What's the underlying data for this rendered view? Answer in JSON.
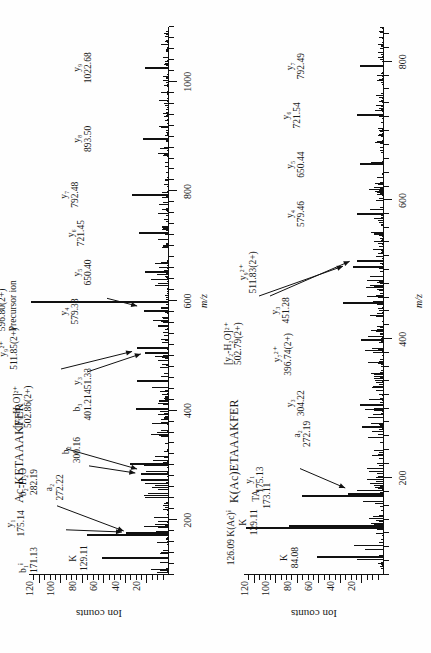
{
  "figure": {
    "axis_y_label": "Ion counts",
    "axis_x_label": "m/z"
  },
  "panels": [
    {
      "id": "panel-a",
      "title": "Ac-KETAAAKFER",
      "xticks": [
        200,
        400,
        600,
        800,
        1000
      ],
      "yticks": [
        20,
        40,
        60,
        80,
        100,
        120
      ],
      "annotations": [
        {
          "name": "ann-k-129",
          "line1": "K",
          "line2": "129.11"
        },
        {
          "name": "ann-b1-171",
          "line1": "b₁ⁱ",
          "line2": "171.13"
        },
        {
          "name": "ann-y1-175",
          "line1": "y₁",
          "line2": "175.14"
        },
        {
          "name": "ann-a2-272",
          "line1": "a₂",
          "line2": "272.22"
        },
        {
          "name": "ann-b2-h2o-282",
          "line1": "b₂-H₂O",
          "line2": "282.19"
        },
        {
          "name": "ann-b2-300",
          "line1": "b₂",
          "line2": "300.16"
        },
        {
          "name": "ann-b3-401",
          "line1": "b₃",
          "line2": "401.21"
        },
        {
          "name": "ann-y3-451",
          "line1": "y₃",
          "line2": "451.33"
        },
        {
          "name": "ann-y9-h2o-502",
          "line1": "[y₉-H₂O]²⁺",
          "line2": "502.86(2+)"
        },
        {
          "name": "ann-y9-2plus-511",
          "line1": "y₉²⁺",
          "line2": "511.85(2+)"
        },
        {
          "name": "ann-y4-579",
          "line1": "y₄",
          "line2": "579.38"
        },
        {
          "name": "ann-precursor",
          "line1": "596.80(2+)",
          "line2": "Precursor ion"
        },
        {
          "name": "ann-y5-650",
          "line1": "y₅",
          "line2": "650.40"
        },
        {
          "name": "ann-y6-721",
          "line1": "y₆",
          "line2": "721.45"
        },
        {
          "name": "ann-y7-792",
          "line1": "y₇",
          "line2": "792.48"
        },
        {
          "name": "ann-y8-893",
          "line1": "y₈",
          "line2": "893.50"
        },
        {
          "name": "ann-y9-1022",
          "line1": "y₉",
          "line2": "1022.68"
        }
      ],
      "chart_data": {
        "type": "line",
        "title": "Ac-KETAAAKFER",
        "xlabel": "m/z",
        "ylabel": "Ion counts",
        "xlim": [
          100,
          1100
        ],
        "ylim": [
          0,
          130
        ],
        "labeled_peaks": [
          {
            "mz": 129.11,
            "intensity": 62,
            "label": "K"
          },
          {
            "mz": 171.13,
            "intensity": 76,
            "label": "b1i"
          },
          {
            "mz": 175.14,
            "intensity": 40,
            "label": "y1"
          },
          {
            "mz": 272.22,
            "intensity": 26,
            "label": "a2"
          },
          {
            "mz": 282.19,
            "intensity": 26,
            "label": "b2-H2O"
          },
          {
            "mz": 300.16,
            "intensity": 36,
            "label": "b2"
          },
          {
            "mz": 401.21,
            "intensity": 31,
            "label": "b3"
          },
          {
            "mz": 451.33,
            "intensity": 30,
            "label": "y3"
          },
          {
            "mz": 502.86,
            "intensity": 22,
            "label": "[y9-H2O]2+"
          },
          {
            "mz": 511.85,
            "intensity": 30,
            "label": "y9 2+"
          },
          {
            "mz": 579.38,
            "intensity": 23,
            "label": "y4"
          },
          {
            "mz": 596.8,
            "intensity": 128,
            "label": "Precursor ion"
          },
          {
            "mz": 650.4,
            "intensity": 22,
            "label": "y5"
          },
          {
            "mz": 721.45,
            "intensity": 28,
            "label": "y6"
          },
          {
            "mz": 792.48,
            "intensity": 34,
            "label": "y7"
          },
          {
            "mz": 893.5,
            "intensity": 24,
            "label": "y8"
          },
          {
            "mz": 1022.68,
            "intensity": 22,
            "label": "y9"
          }
        ]
      }
    },
    {
      "id": "panel-b",
      "title": "K(Ac)ETAAAKFER",
      "xticks": [
        200,
        400,
        600,
        800
      ],
      "yticks": [
        20,
        40,
        60,
        80,
        100,
        120
      ],
      "annotations": [
        {
          "name": "ann-k-84",
          "line1": "K",
          "line2": "84.08"
        },
        {
          "name": "ann-kac-126",
          "line1": "126.09 K(Ac)ⁱ",
          "line2": ""
        },
        {
          "name": "ann-k-129",
          "line1": "K",
          "line2": "129.11"
        },
        {
          "name": "ann-ta-173",
          "line1": "TA",
          "line2": "173.11"
        },
        {
          "name": "ann-y1-175",
          "line1": "y₁",
          "line2": "175.13"
        },
        {
          "name": "ann-a2-272",
          "line1": "a₂",
          "line2": "272.19"
        },
        {
          "name": "ann-y3-304",
          "line1": "y₃",
          "line2": "304.22"
        },
        {
          "name": "ann-y7-2plus-396",
          "line1": "y₇²⁺",
          "line2": "396.74(2+)"
        },
        {
          "name": "ann-y3-451",
          "line1": "y₃",
          "line2": "451.28"
        },
        {
          "name": "ann-y2-h2o-502",
          "line1": "[y₂-H₂O]²⁺",
          "line2": "502.79(2+)"
        },
        {
          "name": "ann-y9-2plus-511",
          "line1": "y₉²⁺",
          "line2": "511.83(2+)"
        },
        {
          "name": "ann-y4-579",
          "line1": "y₄",
          "line2": "579.46"
        },
        {
          "name": "ann-y5-650",
          "line1": "y₅",
          "line2": "650.44"
        },
        {
          "name": "ann-y6-721",
          "line1": "y₆",
          "line2": "721.54"
        },
        {
          "name": "ann-y7-792",
          "line1": "y₇",
          "line2": "792.49"
        }
      ],
      "chart_data": {
        "type": "line",
        "title": "K(Ac)ETAAAKFER",
        "xlabel": "m/z",
        "ylabel": "Ion counts",
        "xlim": [
          60,
          850
        ],
        "ylim": [
          0,
          130
        ],
        "labeled_peaks": [
          {
            "mz": 84.08,
            "intensity": 62,
            "label": "K"
          },
          {
            "mz": 126.09,
            "intensity": 128,
            "label": "K(Ac) immonium"
          },
          {
            "mz": 129.11,
            "intensity": 88,
            "label": "K"
          },
          {
            "mz": 173.11,
            "intensity": 76,
            "label": "TA"
          },
          {
            "mz": 175.13,
            "intensity": 33,
            "label": "y1"
          },
          {
            "mz": 272.19,
            "intensity": 20,
            "label": "a2"
          },
          {
            "mz": 304.22,
            "intensity": 22,
            "label": "y3"
          },
          {
            "mz": 396.74,
            "intensity": 21,
            "label": "y7 2+"
          },
          {
            "mz": 451.28,
            "intensity": 38,
            "label": "y3"
          },
          {
            "mz": 502.79,
            "intensity": 29,
            "label": "[y2-H2O]2+"
          },
          {
            "mz": 511.83,
            "intensity": 25,
            "label": "y9 2+"
          },
          {
            "mz": 579.46,
            "intensity": 25,
            "label": "y4"
          },
          {
            "mz": 650.44,
            "intensity": 22,
            "label": "y5"
          },
          {
            "mz": 721.54,
            "intensity": 25,
            "label": "y6"
          },
          {
            "mz": 792.49,
            "intensity": 22,
            "label": "y7"
          }
        ]
      }
    }
  ]
}
